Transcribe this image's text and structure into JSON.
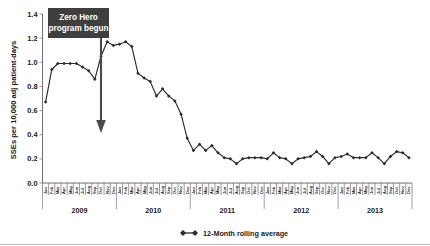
{
  "chart_data": {
    "type": "line",
    "title": "",
    "subtitle": "",
    "xlabel": "",
    "ylabel": "SSEs per 10,000 adj patient-days",
    "ylim": [
      0.0,
      1.4
    ],
    "ytick_labels": [
      "0.0",
      "0.2",
      "0.4",
      "0.6",
      "0.8",
      "1.0",
      "1.2",
      "1.4"
    ],
    "ytick_values": [
      0.0,
      0.2,
      0.4,
      0.6,
      0.8,
      1.0,
      1.2,
      1.4
    ],
    "grid": false,
    "legend_position": "bottom-center",
    "legend": [
      "12-Month rolling average"
    ],
    "year_groups": [
      "2009",
      "2010",
      "2011",
      "2012",
      "2013"
    ],
    "month_labels": [
      "Jan",
      "Feb",
      "Mar",
      "Apr",
      "May",
      "Jun",
      "Jul",
      "Aug",
      "Sep",
      "Oct",
      "Nov",
      "Dec"
    ],
    "categories": [
      "Jan 2009",
      "Feb 2009",
      "Mar 2009",
      "Apr 2009",
      "May 2009",
      "Jun 2009",
      "Jul 2009",
      "Aug 2009",
      "Sep 2009",
      "Oct 2009",
      "Nov 2009",
      "Dec 2009",
      "Jan 2010",
      "Feb 2010",
      "Mar 2010",
      "Apr 2010",
      "May 2010",
      "Jun 2010",
      "Jul 2010",
      "Aug 2010",
      "Sep 2010",
      "Oct 2010",
      "Nov 2010",
      "Dec 2010",
      "Jan 2011",
      "Feb 2011",
      "Mar 2011",
      "Apr 2011",
      "May 2011",
      "Jun 2011",
      "Jul 2011",
      "Aug 2011",
      "Sep 2011",
      "Oct 2011",
      "Nov 2011",
      "Dec 2011",
      "Jan 2012",
      "Feb 2012",
      "Mar 2012",
      "Apr 2012",
      "May 2012",
      "Jun 2012",
      "Jul 2012",
      "Aug 2012",
      "Sep 2012",
      "Oct 2012",
      "Nov 2012",
      "Dec 2012",
      "Jan 2013",
      "Feb 2013",
      "Mar 2013",
      "Apr 2013",
      "May 2013",
      "Jun 2013",
      "Jul 2013",
      "Aug 2013",
      "Sep 2013",
      "Oct 2013",
      "Nov 2013",
      "Dec 2013"
    ],
    "series": [
      {
        "name": "12-Month rolling average",
        "marker": "diamond",
        "color": "#2b2b2b",
        "values": [
          0.67,
          0.94,
          0.99,
          0.99,
          0.99,
          0.99,
          0.96,
          0.93,
          0.86,
          1.05,
          1.17,
          1.14,
          1.15,
          1.17,
          1.13,
          0.91,
          0.87,
          0.84,
          0.72,
          0.78,
          0.72,
          0.68,
          0.57,
          0.37,
          0.27,
          0.32,
          0.27,
          0.31,
          0.25,
          0.21,
          0.2,
          0.16,
          0.2,
          0.21,
          0.21,
          0.21,
          0.2,
          0.25,
          0.21,
          0.2,
          0.16,
          0.2,
          0.21,
          0.22,
          0.26,
          0.22,
          0.16,
          0.21,
          0.22,
          0.24,
          0.21,
          0.21,
          0.21,
          0.25,
          0.21,
          0.16,
          0.22,
          0.26,
          0.25,
          0.21
        ]
      }
    ],
    "annotation": {
      "label_line1": "Zero Hero",
      "label_line2": "program begun",
      "box_color": "#3f3f3f",
      "text_color": "#ffffff",
      "arrow_points_to": "Oct 2009",
      "arrow_color": "#4a4a4a"
    }
  }
}
